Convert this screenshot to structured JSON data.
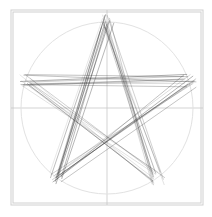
{
  "diagram": {
    "type": "pentagram-string-art",
    "canvas": {
      "width": 212,
      "height": 217,
      "background": "#ffffff"
    },
    "frame": {
      "outer": {
        "x": 11,
        "y": 10,
        "width": 192,
        "height": 195
      },
      "inner": {
        "x": 13,
        "y": 12,
        "width": 188,
        "height": 191
      },
      "color": "#d0d0d0"
    },
    "crosshair": {
      "cx": 107,
      "cy": 108,
      "color": "#c8c8c8"
    },
    "circle": {
      "cx": 107,
      "cy": 108,
      "r": 86,
      "color": "#e2e2e2"
    },
    "star": {
      "cx": 107,
      "cy": 108,
      "points": 5,
      "outer_radius": 87,
      "inner_radius": 33,
      "rotation_deg": -90,
      "lines_per_edge": 9,
      "jitter": 7,
      "line_color": "#3a3a3a",
      "line_opacity_min": 0.18,
      "line_opacity_max": 0.7
    }
  }
}
